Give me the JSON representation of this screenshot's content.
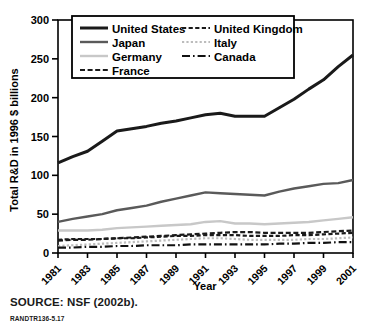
{
  "figure": {
    "source_note": "SOURCE: NSF (2002b).",
    "figure_id": "RANDTR136-5.17"
  },
  "chart_data": {
    "type": "line",
    "title": "",
    "xlabel": "Year",
    "ylabel": "Total R&D in 1996 $ billions",
    "xlim": [
      1981,
      2001
    ],
    "ylim": [
      0,
      300
    ],
    "yticks": [
      0,
      50,
      100,
      150,
      200,
      250,
      300
    ],
    "xticks": [
      1981,
      1983,
      1985,
      1987,
      1989,
      1991,
      1993,
      1995,
      1997,
      1999,
      2001
    ],
    "grid": false,
    "legend_position": "top-center",
    "x": [
      1981,
      1982,
      1983,
      1984,
      1985,
      1986,
      1987,
      1988,
      1989,
      1990,
      1991,
      1992,
      1993,
      1994,
      1995,
      1996,
      1997,
      1998,
      1999,
      2000,
      2001
    ],
    "series": [
      {
        "name": "United States",
        "color": "#1a1a1a",
        "style": "solid",
        "width": 3.0,
        "values": [
          116,
          124,
          131,
          144,
          157,
          160,
          163,
          167,
          170,
          174,
          178,
          180,
          176,
          176,
          176,
          187,
          198,
          211,
          223,
          240,
          255
        ]
      },
      {
        "name": "Japan",
        "color": "#5a5a5a",
        "style": "solid",
        "width": 2.4,
        "values": [
          40,
          44,
          47,
          50,
          55,
          58,
          61,
          66,
          70,
          74,
          78,
          77,
          76,
          75,
          74,
          79,
          83,
          86,
          89,
          90,
          94
        ]
      },
      {
        "name": "Germany",
        "color": "#c8c8c8",
        "style": "solid",
        "width": 2.4,
        "values": [
          29,
          29,
          29,
          30,
          32,
          33,
          34,
          35,
          36,
          37,
          40,
          41,
          38,
          38,
          37,
          38,
          39,
          40,
          42,
          44,
          46
        ]
      },
      {
        "name": "France",
        "color": "#1a1a1a",
        "style": "dashed",
        "width": 2.2,
        "values": [
          16,
          17,
          17,
          18,
          19,
          20,
          21,
          22,
          23,
          24,
          25,
          26,
          27,
          27,
          26,
          26,
          26,
          26,
          27,
          28,
          29
        ]
      },
      {
        "name": "United Kingdom",
        "color": "#1a1a1a",
        "style": "fine-dashed",
        "width": 2.2,
        "values": [
          17,
          18,
          18,
          18,
          19,
          19,
          20,
          21,
          22,
          22,
          23,
          23,
          23,
          22,
          22,
          22,
          23,
          23,
          24,
          25,
          26
        ]
      },
      {
        "name": "Italy",
        "color": "#bcbcbc",
        "style": "dotted",
        "width": 2.2,
        "values": [
          9,
          10,
          11,
          12,
          13,
          14,
          15,
          16,
          17,
          18,
          19,
          19,
          18,
          17,
          17,
          17,
          17,
          18,
          18,
          19,
          20
        ]
      },
      {
        "name": "Canada",
        "color": "#111111",
        "style": "dash-dot",
        "width": 2.2,
        "values": [
          7,
          7,
          8,
          8,
          9,
          9,
          10,
          10,
          10,
          11,
          11,
          11,
          11,
          11,
          11,
          12,
          12,
          13,
          13,
          14,
          14
        ]
      }
    ]
  },
  "legend": {
    "items": [
      {
        "label": "United States"
      },
      {
        "label": "Japan"
      },
      {
        "label": "Germany"
      },
      {
        "label": "France"
      },
      {
        "label": "United Kingdom"
      },
      {
        "label": "Italy"
      },
      {
        "label": "Canada"
      }
    ]
  }
}
